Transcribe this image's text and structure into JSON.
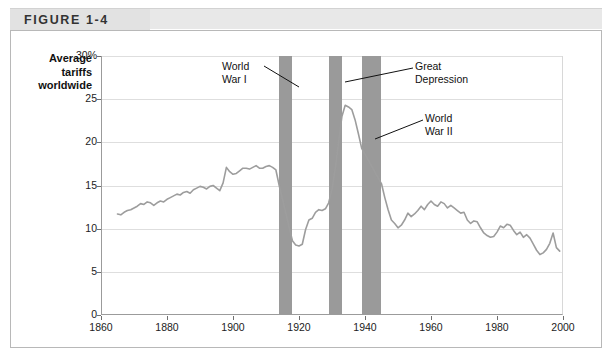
{
  "figure": {
    "label": "FIGURE 1-4"
  },
  "axis_title": {
    "line1": "Average",
    "line2": "tariffs",
    "line3": "worldwide"
  },
  "colors": {
    "series_line": "#9d9d9d",
    "band_fill": "#9a9a9a",
    "gridline": "#dedede",
    "axis": "#9b9b9b",
    "header_band": "#e8e8e8",
    "panel_border": "#b8b8b8",
    "text": "#1c1c1c"
  },
  "chart_data": {
    "type": "line",
    "title": "FIGURE 1-4",
    "xlabel": "",
    "ylabel": "Average tariffs worldwide",
    "xlim": [
      1860,
      2000
    ],
    "ylim": [
      0,
      30
    ],
    "grid": true,
    "legend": "none",
    "y_ticks": [
      {
        "value": 30,
        "label": "30%"
      },
      {
        "value": 25,
        "label": "25"
      },
      {
        "value": 20,
        "label": "20"
      },
      {
        "value": 15,
        "label": "15"
      },
      {
        "value": 10,
        "label": "10"
      },
      {
        "value": 5,
        "label": "5"
      },
      {
        "value": 0,
        "label": "0"
      }
    ],
    "x_ticks": [
      {
        "value": 1860,
        "label": "1860"
      },
      {
        "value": 1880,
        "label": "1880"
      },
      {
        "value": 1900,
        "label": "1900"
      },
      {
        "value": 1920,
        "label": "1920"
      },
      {
        "value": 1940,
        "label": "1940"
      },
      {
        "value": 1960,
        "label": "1960"
      },
      {
        "value": 1980,
        "label": "1980"
      },
      {
        "value": 2000,
        "label": "2000"
      }
    ],
    "series": [
      {
        "name": "Average tariffs worldwide",
        "unit": "percent",
        "x": [
          1865,
          1866,
          1867,
          1868,
          1869,
          1870,
          1871,
          1872,
          1873,
          1874,
          1875,
          1876,
          1877,
          1878,
          1879,
          1880,
          1881,
          1882,
          1883,
          1884,
          1885,
          1886,
          1887,
          1888,
          1889,
          1890,
          1891,
          1892,
          1893,
          1894,
          1895,
          1896,
          1897,
          1898,
          1899,
          1900,
          1901,
          1902,
          1903,
          1904,
          1905,
          1906,
          1907,
          1908,
          1909,
          1910,
          1911,
          1912,
          1913,
          1914,
          1918,
          1919,
          1920,
          1921,
          1922,
          1923,
          1924,
          1925,
          1926,
          1927,
          1928,
          1929,
          1930,
          1931,
          1932,
          1933,
          1934,
          1935,
          1936,
          1937,
          1938,
          1939,
          1945,
          1946,
          1947,
          1948,
          1949,
          1950,
          1951,
          1952,
          1953,
          1954,
          1955,
          1956,
          1957,
          1958,
          1959,
          1960,
          1961,
          1962,
          1963,
          1964,
          1965,
          1966,
          1967,
          1968,
          1969,
          1970,
          1971,
          1972,
          1973,
          1974,
          1975,
          1976,
          1977,
          1978,
          1979,
          1980,
          1981,
          1982,
          1983,
          1984,
          1985,
          1986,
          1987,
          1988,
          1989,
          1990,
          1991,
          1992,
          1993,
          1994,
          1995,
          1996,
          1997,
          1998,
          1999
        ],
        "y": [
          11.7,
          11.6,
          11.9,
          12.1,
          12.2,
          12.4,
          12.6,
          12.9,
          12.8,
          13.1,
          13.0,
          12.7,
          13.0,
          13.2,
          13.1,
          13.4,
          13.6,
          13.8,
          14.0,
          13.9,
          14.2,
          14.3,
          14.1,
          14.5,
          14.7,
          14.9,
          14.8,
          14.6,
          14.9,
          15.0,
          14.7,
          14.4,
          15.3,
          17.1,
          16.6,
          16.3,
          16.4,
          16.7,
          17.0,
          17.0,
          16.9,
          17.1,
          17.3,
          17.0,
          17.0,
          17.2,
          17.3,
          17.1,
          16.8,
          15.0,
          8.6,
          8.1,
          8.0,
          8.2,
          9.9,
          11.0,
          11.2,
          11.9,
          12.2,
          12.1,
          12.3,
          13.0,
          14.5,
          17.0,
          20.0,
          23.0,
          24.3,
          24.1,
          23.8,
          22.6,
          21.0,
          19.3,
          15.2,
          13.6,
          12.2,
          11.0,
          10.6,
          10.1,
          10.4,
          11.0,
          11.8,
          11.4,
          11.7,
          12.1,
          12.6,
          12.2,
          12.8,
          13.2,
          12.8,
          12.6,
          13.1,
          12.9,
          12.4,
          12.7,
          12.4,
          12.1,
          11.8,
          11.9,
          11.0,
          10.6,
          10.9,
          10.8,
          10.1,
          9.5,
          9.2,
          9.0,
          9.1,
          9.6,
          10.3,
          10.1,
          10.5,
          10.4,
          9.8,
          9.3,
          9.6,
          9.0,
          9.3,
          8.9,
          8.2,
          7.5,
          7.0,
          7.2,
          7.6,
          8.3,
          9.5,
          7.8,
          7.4
        ]
      }
    ],
    "shaded_bands": [
      {
        "name": "World War I",
        "start": 1914,
        "end": 1918,
        "label": "World War I"
      },
      {
        "name": "Great Depression",
        "start": 1929,
        "end": 1933,
        "label": "Great Depression"
      },
      {
        "name": "World War II",
        "start": 1939,
        "end": 1945,
        "label": "World War II"
      }
    ],
    "annotations": [
      {
        "id": "ww1",
        "line1": "World",
        "line2": "War I"
      },
      {
        "id": "depression",
        "line1": "Great",
        "line2": "Depression"
      },
      {
        "id": "ww2",
        "line1": "World",
        "line2": "War II"
      }
    ]
  }
}
